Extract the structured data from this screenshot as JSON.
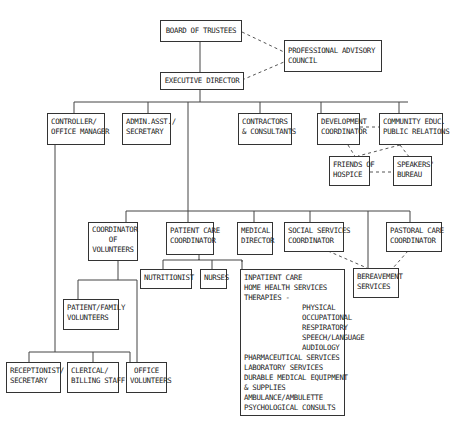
{
  "nodes": {
    "board": "BOARD OF TRUSTEES",
    "advisory": "PROFESSIONAL ADVISORY\nCOUNCIL",
    "exec": "EXECUTIVE DIRECTOR",
    "controller": "CONTROLLER/\nOFFICE MANAGER",
    "admin": "ADMIN.ASST./\nSECRETARY",
    "contractors": "CONTRACTORS\n& CONSULTANTS",
    "development": "DEVELOPMENT\nCOORDINATOR",
    "community": "COMMUNITY EDUC.\nPUBLIC RELATIONS",
    "friends": "FRIENDS OF\nHOSPICE",
    "speakers": "SPEAKERS'\nBUREAU",
    "volunteers_coord": "COORDINATOR\nOF\nVOLUNTEERS",
    "patient_care": "PATIENT CARE\nCOORDINATOR",
    "medical": "MEDICAL\nDIRECTOR",
    "social": "SOCIAL SERVICES\nCOORDINATOR",
    "pastoral": "PASTORAL CARE\nCOORDINATOR",
    "nutritionist": "NUTRITIONIST",
    "nurses": "NURSES",
    "services": "INPATIENT CARE\nHOME HEALTH SERVICES\nTHERAPIES -\n              PHYSICAL\n              OCCUPATIONAL\n              RESPIRATORY\n              SPEECH/LANGUAGE\n              AUDIOLOGY\nPHARMACEUTICAL SERVICES\nLABORATORY SERVICES\nDURABLE MEDICAL EQUIPMENT\n& SUPPLIES\nAMBULANCE/AMBULETTE\nPSYCHOLOGICAL CONSULTS",
    "bereavement": "BEREAVEMENT\nSERVICES",
    "patient_family": "PATIENT/FAMILY\nVOLUNTEERS",
    "receptionist": "RECEPTIONIST/\nSECRETARY",
    "clerical": "CLERICAL/\nBILLING STAFF",
    "office_vol": "OFFICE\nVOLUNTEERS"
  }
}
